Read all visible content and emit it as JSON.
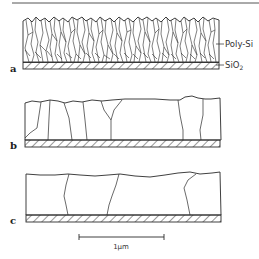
{
  "figure": {
    "panels": [
      {
        "id": "a",
        "label": "a",
        "description": "As-deposited fine columnar polycrystalline Si film on SiO2"
      },
      {
        "id": "b",
        "label": "b",
        "description": "Coarsened grains after recrystallization"
      },
      {
        "id": "c",
        "label": "c",
        "description": "Large grains spanning film thickness"
      }
    ],
    "layer_labels": {
      "poly_si": "Poly-Si",
      "sio2": "SiO",
      "sio2_subscript": "2"
    },
    "scale_bar": {
      "label": "1μm",
      "length_px": 85
    },
    "colors": {
      "line": "#2a2a2a",
      "background": "#ffffff"
    }
  }
}
